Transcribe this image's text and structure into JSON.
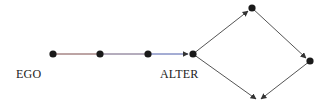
{
  "diagram": {
    "labels": {
      "ego": "EGO",
      "alter": "ALTER"
    },
    "colors": {
      "node": "#1a1a1a",
      "edge_default": "#555555",
      "edge_ego_segment": "#7a4a4a",
      "edge_mid_segment": "#6a5a7a",
      "edge_blue_segment": "#4a5aa8",
      "label": "#222222"
    },
    "nodes": [
      {
        "id": "ego",
        "x": 53,
        "y": 54
      },
      {
        "id": "n2",
        "x": 100,
        "y": 54
      },
      {
        "id": "n3",
        "x": 148,
        "y": 54
      },
      {
        "id": "alter",
        "x": 193,
        "y": 54
      },
      {
        "id": "top",
        "x": 252,
        "y": 8
      },
      {
        "id": "right",
        "x": 310,
        "y": 61
      }
    ],
    "edges": [
      {
        "from": "ego",
        "to": "n2",
        "arrow": false
      },
      {
        "from": "n2",
        "to": "n3",
        "arrow": false
      },
      {
        "from": "n3",
        "to": "alter",
        "arrow": true
      },
      {
        "from": "alter",
        "to": "top",
        "arrow": true
      },
      {
        "from": "top",
        "to": "right",
        "arrow": true
      },
      {
        "from": "alter",
        "to": "bottom",
        "arrow": true
      },
      {
        "from": "right",
        "to": "bottom",
        "arrow": true
      }
    ]
  }
}
